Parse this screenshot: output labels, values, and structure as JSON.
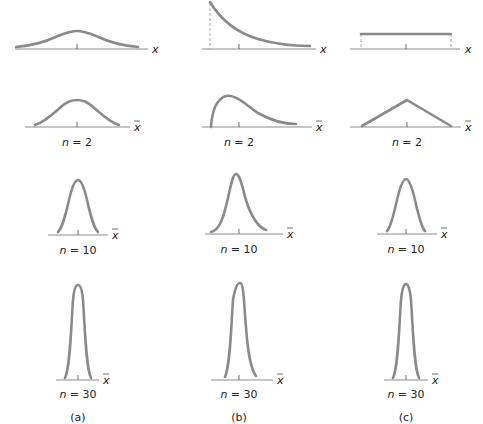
{
  "figure": {
    "columns": [
      {
        "id": "a",
        "caption": "(a)",
        "population_shape": "normal"
      },
      {
        "id": "b",
        "caption": "(b)",
        "population_shape": "exponential / right-skewed"
      },
      {
        "id": "c",
        "caption": "(c)",
        "population_shape": "uniform"
      }
    ],
    "rows": [
      {
        "id": "population",
        "axis_label": "x",
        "n_label": ""
      },
      {
        "id": "n2",
        "axis_label": "x̄",
        "n_label": "n = 2",
        "n_var": "n",
        "n_value": "= 2"
      },
      {
        "id": "n10",
        "axis_label": "x̄",
        "n_label": "n = 10",
        "n_var": "n",
        "n_value": "= 10"
      },
      {
        "id": "n30",
        "axis_label": "x̄",
        "n_label": "n = 30",
        "n_var": "n",
        "n_value": "= 30"
      }
    ],
    "colors": {
      "curve": "#8a8a8a",
      "axis": "#8c8c8c",
      "text": "#222222"
    }
  },
  "labels": {
    "x": "x",
    "xbar": "x",
    "n": "n",
    "eq2": " = 2",
    "eq10": " = 10",
    "eq30": " = 30",
    "cap_a": "(a)",
    "cap_b": "(b)",
    "cap_c": "(c)"
  }
}
